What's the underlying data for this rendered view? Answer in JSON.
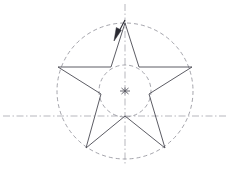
{
  "figure": {
    "title": "Pentagram construction diagram",
    "background_color": "#ffffff",
    "canvas": {
      "width": 230,
      "height": 173
    },
    "colors": {
      "star_stroke": "#4a4a52",
      "construction_dash": "#8d8d96",
      "centerline_dash": "#9a9aa2",
      "arrow_fill": "#2b2b33",
      "center_mark": "#5a5a62"
    },
    "geometry": {
      "center": {
        "x": 125,
        "y": 91
      },
      "outer_circle_radius": 68,
      "inner_circle_radius": 26,
      "star_outer_radius": 68,
      "star_inner_radius": 26,
      "rotation_degrees": -90
    },
    "elements": [
      {
        "name": "outer-construction-circle",
        "kind": "circle",
        "style": "dashed",
        "cx": 125,
        "cy": 91,
        "r": 68
      },
      {
        "name": "inner-construction-circle",
        "kind": "circle",
        "style": "dashed",
        "cx": 125,
        "cy": 91,
        "r": 26
      },
      {
        "name": "horizontal-centerline",
        "kind": "line",
        "style": "dash-dot",
        "x1": 3,
        "y1": 116,
        "x2": 228,
        "y2": 116
      },
      {
        "name": "vertical-centerline",
        "kind": "line",
        "style": "dash-dot",
        "x1": 125,
        "y1": 4,
        "x2": 125,
        "y2": 166
      },
      {
        "name": "star-polygon",
        "kind": "polygon",
        "style": "solid",
        "points": "125,23 139,67 192,67 149,94 165,148 125,116 86,148 101,94 58,67 111,67"
      },
      {
        "name": "center-cross-mark",
        "kind": "cross",
        "cx": 125,
        "cy": 91,
        "arm": 5
      },
      {
        "name": "top-vertex-arrow",
        "kind": "arrow",
        "from": {
          "x": 125,
          "y": 20
        },
        "to": {
          "x": 114,
          "y": 41
        }
      }
    ],
    "star_vertices": [
      {
        "name": "top-point",
        "x": 125,
        "y": 23,
        "type": "outer"
      },
      {
        "name": "upper-right-inner",
        "x": 139,
        "y": 67,
        "type": "inner"
      },
      {
        "name": "right-point",
        "x": 192,
        "y": 67,
        "type": "outer"
      },
      {
        "name": "lower-right-inner",
        "x": 149,
        "y": 94,
        "type": "inner"
      },
      {
        "name": "bottom-right-point",
        "x": 165,
        "y": 148,
        "type": "outer"
      },
      {
        "name": "bottom-inner",
        "x": 125,
        "y": 116,
        "type": "inner"
      },
      {
        "name": "bottom-left-point",
        "x": 86,
        "y": 148,
        "type": "outer"
      },
      {
        "name": "lower-left-inner",
        "x": 101,
        "y": 94,
        "type": "inner"
      },
      {
        "name": "left-point",
        "x": 58,
        "y": 67,
        "type": "outer"
      },
      {
        "name": "upper-left-inner",
        "x": 111,
        "y": 67,
        "type": "inner"
      }
    ]
  }
}
